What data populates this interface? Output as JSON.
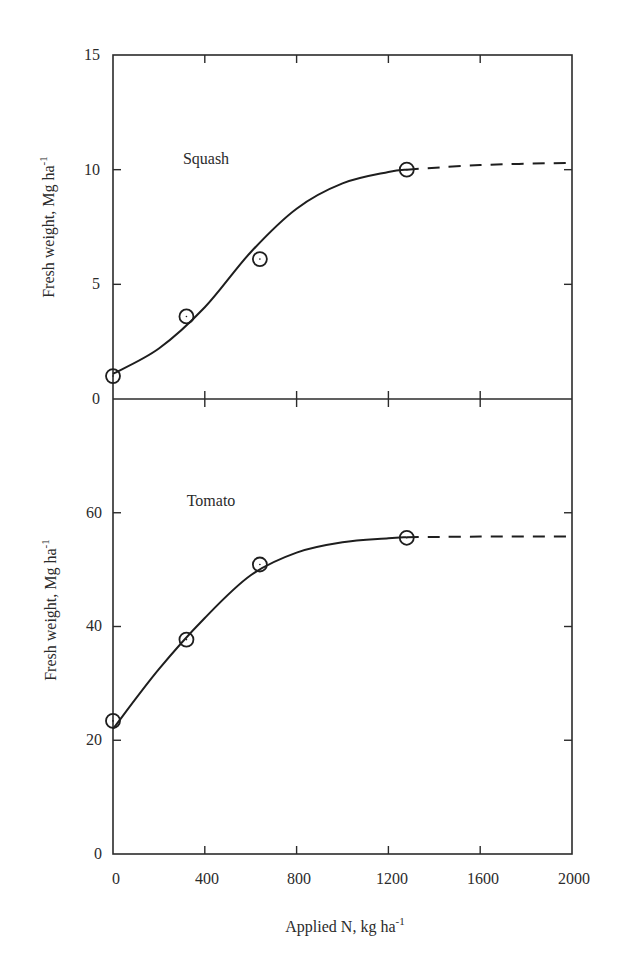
{
  "chart_data": [
    {
      "type": "line",
      "title": "Squash",
      "xlabel": "Applied N, kg ha-1",
      "ylabel": "Fresh weight, Mg ha-1",
      "xlim": [
        0,
        2000
      ],
      "ylim": [
        0,
        15
      ],
      "x_ticks": [
        0,
        400,
        800,
        1200,
        1600,
        2000
      ],
      "y_ticks": [
        0,
        5,
        10,
        15
      ],
      "grid": false,
      "series": [
        {
          "name": "Squash observed",
          "style": "open-circle",
          "x": [
            0,
            320,
            640,
            1280
          ],
          "y": [
            1.0,
            3.6,
            6.1,
            10.0
          ]
        },
        {
          "name": "Squash fitted curve",
          "style": "solid-line",
          "x": [
            0,
            200,
            400,
            600,
            800,
            1000,
            1200,
            1280
          ],
          "y": [
            1.1,
            2.2,
            4.0,
            6.4,
            8.3,
            9.4,
            9.9,
            10.0
          ]
        },
        {
          "name": "Squash extrapolation",
          "style": "dashed-line",
          "x": [
            1280,
            1600,
            2000
          ],
          "y": [
            10.0,
            10.2,
            10.3
          ]
        }
      ]
    },
    {
      "type": "line",
      "title": "Tomato",
      "xlabel": "Applied N, kg ha-1",
      "ylabel": "Fresh weight, Mg ha-1",
      "xlim": [
        0,
        2000
      ],
      "ylim": [
        0,
        80
      ],
      "x_ticks": [
        0,
        400,
        800,
        1200,
        1600,
        2000
      ],
      "y_ticks": [
        0,
        20,
        40,
        60
      ],
      "grid": false,
      "series": [
        {
          "name": "Tomato observed",
          "style": "open-circle",
          "x": [
            0,
            320,
            640,
            1280
          ],
          "y": [
            23.4,
            37.7,
            50.9,
            55.6
          ]
        },
        {
          "name": "Tomato fitted curve",
          "style": "solid-line",
          "x": [
            0,
            200,
            400,
            600,
            800,
            1000,
            1200,
            1280
          ],
          "y": [
            22.0,
            32.5,
            41.5,
            49.0,
            53.0,
            54.8,
            55.5,
            55.7
          ]
        },
        {
          "name": "Tomato extrapolation",
          "style": "dashed-line",
          "x": [
            1280,
            1600,
            2000
          ],
          "y": [
            55.7,
            55.8,
            55.8
          ]
        }
      ]
    }
  ],
  "labels": {
    "squash_panel": "Squash",
    "tomato_panel": "Tomato",
    "y_axis_top_main": "Fresh weight, Mg ha",
    "y_axis_top_sup": "-1",
    "y_axis_bottom_main": "Fresh weight, Mg ha",
    "y_axis_bottom_sup": "-1",
    "x_axis_main": "Applied N, kg ha",
    "x_axis_sup": "-1"
  },
  "ticks": {
    "squash_y": [
      "0",
      "5",
      "10",
      "15"
    ],
    "tomato_y": [
      "0",
      "20",
      "40",
      "60"
    ],
    "x": [
      "0",
      "400",
      "800",
      "1200",
      "1600",
      "2000"
    ]
  },
  "colors": {
    "ink": "#1e1e1e",
    "background": "#ffffff"
  }
}
